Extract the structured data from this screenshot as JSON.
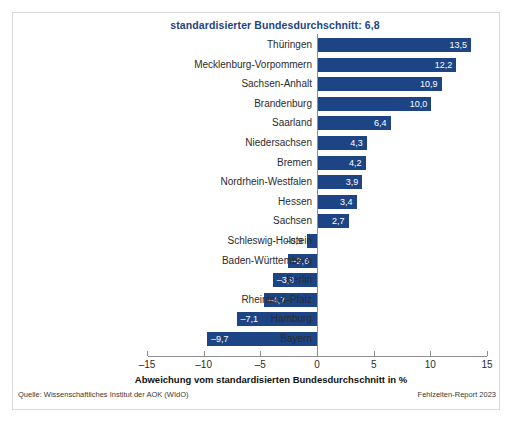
{
  "chart_data": {
    "type": "bar",
    "orientation": "horizontal",
    "title": "standardisierter Bundesdurchschnitt: 6,8",
    "xlabel": "Abweichung vom standardisierten Bundesdurchschnitt in %",
    "ylabel": "",
    "xlim": [
      -15,
      15
    ],
    "xticks": [
      -15,
      -10,
      -5,
      0,
      5,
      10,
      15
    ],
    "xtick_labels": [
      "–15",
      "–10",
      "–5",
      "0",
      "5",
      "10",
      "15"
    ],
    "grid": false,
    "legend": null,
    "bar_color": "#1d4586",
    "categories": [
      "Thüringen",
      "Mecklenburg-Vorpommern",
      "Sachsen-Anhalt",
      "Brandenburg",
      "Saarland",
      "Niedersachsen",
      "Bremen",
      "Nordrhein-Westfalen",
      "Hessen",
      "Sachsen",
      "Schleswig-Holstein",
      "Baden-Württemberg",
      "Berlin",
      "Rheinland-Pfalz",
      "Hamburg",
      "Bayern"
    ],
    "values": [
      13.5,
      12.2,
      10.9,
      10.0,
      6.4,
      4.3,
      4.2,
      3.9,
      3.4,
      2.7,
      -0.9,
      -2.6,
      -3.9,
      -4.7,
      -7.1,
      -9.7
    ],
    "value_labels": [
      "13,5",
      "12,2",
      "10,9",
      "10,0",
      "6,4",
      "4,3",
      "4,2",
      "3,9",
      "3,4",
      "2,7",
      "–0,9",
      "–2,6",
      "–3,9",
      "–4,7",
      "–7,1",
      "–9,7"
    ],
    "reference_value": 6.8,
    "reference_label": "standardisierter Bundesdurchschnitt: 6,8"
  },
  "footer": {
    "source": "Quelle: Wissenschaftliches Institut der AOK (WIdO)",
    "report": "Fehlzeiten-Report 2023"
  }
}
